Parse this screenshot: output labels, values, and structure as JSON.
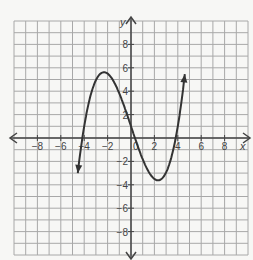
{
  "chart_data": {
    "type": "line",
    "title": "",
    "xlabel": "x",
    "ylabel": "y",
    "xlim": [
      -10,
      10
    ],
    "ylim": [
      -10,
      10
    ],
    "grid": true,
    "x_ticks": [
      "-8",
      "-6",
      "-4",
      "-2",
      "0",
      "2",
      "4",
      "6",
      "8"
    ],
    "y_ticks": [
      "8",
      "6",
      "4",
      "2",
      "-2",
      "-4",
      "-6",
      "-8"
    ],
    "series": [
      {
        "name": "cubic curve",
        "x": [
          -4.5,
          -4,
          -3,
          -2,
          -1,
          0,
          1,
          2,
          3,
          4,
          4.6
        ],
        "y": [
          -10,
          -0.5,
          5.2,
          7,
          5,
          0.5,
          -3.5,
          -5,
          -3.2,
          0.5,
          10
        ],
        "features": {
          "local_max": [
            -2,
            7
          ],
          "local_min": [
            2,
            -5
          ],
          "x_intercepts": [
            -4,
            -0.2,
            4
          ],
          "end_behavior": "arrows at both ends"
        }
      }
    ],
    "colors": {
      "curve": "#333333",
      "grid": "#a8a8a8",
      "axes": "#444444"
    }
  }
}
